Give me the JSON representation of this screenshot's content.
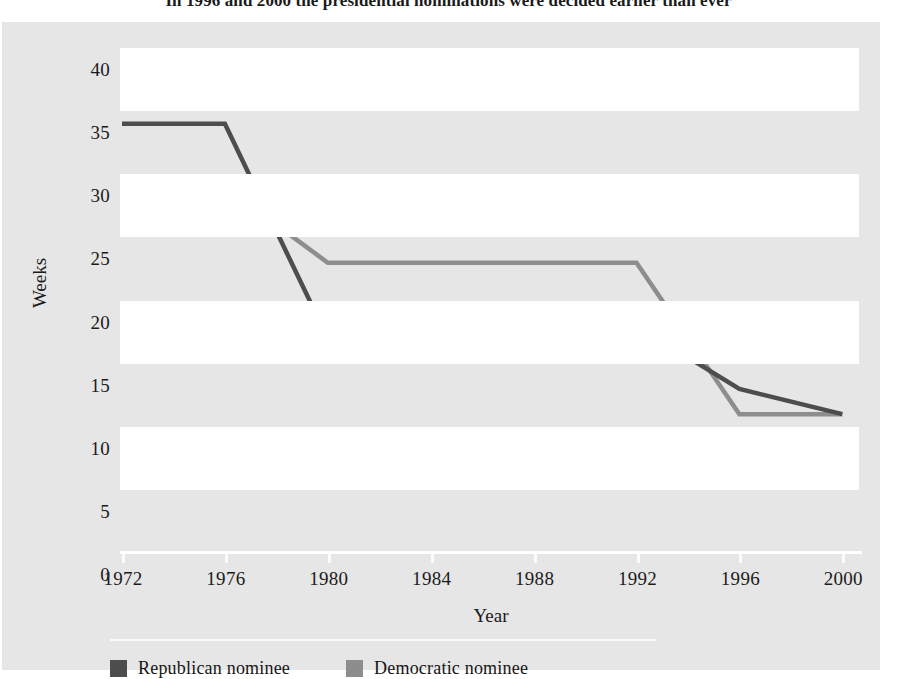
{
  "figure": {
    "title": "In 1996 and 2000 the presidential nominations were decided earlier than ever"
  },
  "colors": {
    "republican": "#4d4d4d",
    "democratic": "#8d8d8d",
    "panel_background": "#e6e6e6",
    "band_background": "#ffffff",
    "axis": "#ffffff",
    "text": "#1b1b1b"
  },
  "legend": {
    "position": "bottom-left",
    "items": [
      {
        "label": "Republican nominee",
        "color": "#4d4d4d",
        "swatch": "republican-swatch"
      },
      {
        "label": "Democratic nominee",
        "color": "#8d8d8d",
        "swatch": "democratic-swatch"
      }
    ]
  },
  "chart_data": {
    "type": "line",
    "title": "In 1996 and 2000 the presidential nominations were decided earlier than ever",
    "xlabel": "Year",
    "ylabel": "Weeks",
    "x": [
      1972,
      1976,
      1980,
      1984,
      1988,
      1992,
      1996,
      2000
    ],
    "categories": [
      "1972",
      "1976",
      "1980",
      "1984",
      "1988",
      "1992",
      "1996",
      "2000"
    ],
    "xlim": [
      1972,
      2000
    ],
    "ylim": [
      0,
      40
    ],
    "yticks": [
      0,
      5,
      10,
      15,
      20,
      25,
      30,
      35,
      40
    ],
    "ytick_labels": [
      "0",
      "5",
      "10",
      "15",
      "20",
      "25",
      "30",
      "35",
      "40"
    ],
    "grid": "horizontal-alternating-bands",
    "legend_position": "below-axis-left",
    "series": [
      {
        "name": "Republican nominee",
        "color": "#4d4d4d",
        "values": [
          34,
          34,
          17,
          19,
          17,
          18,
          13,
          11
        ]
      },
      {
        "name": "Democratic nominee",
        "color": "#8d8d8d",
        "values": [
          28,
          29,
          23,
          23,
          23,
          23,
          11,
          11
        ]
      }
    ]
  }
}
